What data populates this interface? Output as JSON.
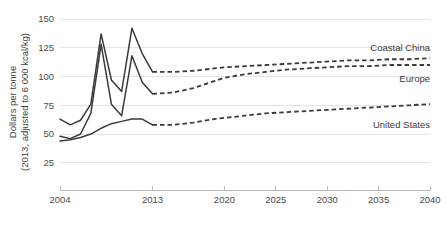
{
  "chart_data": {
    "type": "line",
    "title": "",
    "xlabel": "",
    "ylabel": "Dollars per tonne (2013, adjusted to 6 000 kcal/kg)",
    "ylabel_line1": "Dollars per tonne",
    "ylabel_line2": "(2013, adjusted to 6 000 kcal/kg)",
    "xlim": [
      2004,
      2040
    ],
    "ylim": [
      0,
      150
    ],
    "yticks": [
      25,
      50,
      75,
      100,
      125,
      150
    ],
    "ytick_labels": [
      "25",
      "50",
      "75",
      "100",
      "125",
      "150"
    ],
    "xticks": [
      2004,
      2013,
      2020,
      2025,
      2030,
      2035,
      2040
    ],
    "xtick_labels": [
      "2004",
      "2013",
      "2020",
      "2025",
      "2030",
      "2035",
      "2040"
    ],
    "grid": true,
    "grid_axis": "y",
    "legend_position": "inline-right-of-line-ends",
    "history_projection_split_year": 2013,
    "series": [
      {
        "name": "Coastal China",
        "label": "Coastal China",
        "color": "#3a3a3a",
        "style_history": "solid",
        "style_projection": "dashed",
        "label_x": 2040,
        "label_y": 125,
        "x": [
          2004,
          2005,
          2006,
          2007,
          2008,
          2009,
          2010,
          2011,
          2012,
          2013,
          2015,
          2017,
          2019,
          2020,
          2022,
          2024,
          2026,
          2028,
          2030,
          2032,
          2034,
          2036,
          2038,
          2040
        ],
        "y": [
          63,
          58,
          62,
          76,
          137,
          97,
          87,
          142,
          120,
          104,
          104,
          105,
          107,
          108,
          109,
          110,
          111,
          112,
          113,
          114,
          114,
          115,
          115,
          116
        ]
      },
      {
        "name": "Europe",
        "label": "Europe",
        "color": "#3a3a3a",
        "style_history": "solid",
        "style_projection": "dashed",
        "label_x": 2040,
        "label_y": 98,
        "x": [
          2004,
          2005,
          2006,
          2007,
          2008,
          2009,
          2010,
          2011,
          2012,
          2013,
          2015,
          2017,
          2019,
          2020,
          2022,
          2024,
          2026,
          2028,
          2030,
          2032,
          2034,
          2036,
          2038,
          2040
        ],
        "y": [
          48,
          46,
          50,
          68,
          128,
          76,
          66,
          118,
          95,
          85,
          86,
          90,
          96,
          99,
          102,
          104,
          106,
          107,
          108,
          109,
          109,
          110,
          110,
          110
        ]
      },
      {
        "name": "United States",
        "label": "United States",
        "color": "#3a3a3a",
        "style_history": "solid",
        "style_projection": "dashed",
        "label_x": 2040,
        "label_y": 58,
        "x": [
          2004,
          2005,
          2006,
          2007,
          2008,
          2009,
          2010,
          2011,
          2012,
          2013,
          2015,
          2017,
          2019,
          2020,
          2022,
          2024,
          2026,
          2028,
          2030,
          2032,
          2034,
          2036,
          2038,
          2040
        ],
        "y": [
          44,
          45,
          47,
          50,
          55,
          59,
          61,
          63,
          63,
          58,
          58,
          60,
          63,
          64,
          66,
          68,
          69,
          70,
          71,
          72,
          73,
          74,
          75,
          76
        ]
      }
    ]
  }
}
